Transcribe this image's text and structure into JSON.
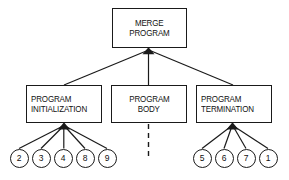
{
  "diagram": {
    "type": "hierarchy-tree",
    "background_color": "#ffffff",
    "line_color": "#1a1a1a",
    "text_color": "#111111",
    "root": {
      "id": "merge-program",
      "lines": [
        "MERGE",
        "PROGRAM"
      ],
      "x": 112,
      "y": 8,
      "w": 75,
      "h": 40,
      "align": "center"
    },
    "level2": [
      {
        "id": "program-initialization",
        "lines": [
          "PROGRAM",
          "INITIALIZATION"
        ],
        "x": 26,
        "y": 85,
        "w": 76,
        "h": 38,
        "align": "left"
      },
      {
        "id": "program-body",
        "lines": [
          "PROGRAM",
          "BODY"
        ],
        "x": 111,
        "y": 85,
        "w": 76,
        "h": 38,
        "align": "center"
      },
      {
        "id": "program-termination",
        "lines": [
          "PROGRAM",
          "TERMINATION"
        ],
        "x": 196,
        "y": 85,
        "w": 76,
        "h": 38,
        "align": "left"
      }
    ],
    "leaves_left": [
      {
        "id": "leaf-2",
        "label": "2",
        "cx": 19,
        "cy": 158
      },
      {
        "id": "leaf-3",
        "label": "3",
        "cx": 41,
        "cy": 158
      },
      {
        "id": "leaf-4",
        "label": "4",
        "cx": 63,
        "cy": 158
      },
      {
        "id": "leaf-8",
        "label": "8",
        "cx": 85,
        "cy": 158
      },
      {
        "id": "leaf-9",
        "label": "9",
        "cx": 107,
        "cy": 158
      }
    ],
    "leaves_right": [
      {
        "id": "leaf-5",
        "label": "5",
        "cx": 202,
        "cy": 158
      },
      {
        "id": "leaf-6",
        "label": "6",
        "cx": 224,
        "cy": 158
      },
      {
        "id": "leaf-7",
        "label": "7",
        "cx": 246,
        "cy": 158
      },
      {
        "id": "leaf-1",
        "label": "1",
        "cx": 268,
        "cy": 158
      }
    ],
    "dashed_connector": {
      "id": "program-body-dashed-stub",
      "from_x": 148,
      "from_y": 123,
      "to_x": 148,
      "to_y": 156,
      "style": "dashed"
    }
  }
}
